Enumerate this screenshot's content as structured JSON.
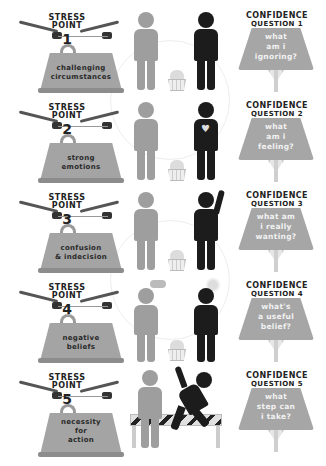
{
  "header": {
    "partial_title": ""
  },
  "rows": [
    {
      "stress": {
        "title_line1": "STRESS",
        "title_line2": "POINT",
        "number": "1",
        "label_line1": "challenging",
        "label_line2": "circumstances",
        "label_line3": ""
      },
      "figures": {
        "scene": "person-on-phone-and-standing-person-with-bucket"
      },
      "confidence": {
        "title": "CONFIDENCE",
        "subtitle": "QUESTION 1",
        "line1": "WHAT",
        "line2": "am I",
        "line3": "IGNORING?"
      }
    },
    {
      "stress": {
        "title_line1": "STRESS",
        "title_line2": "POINT",
        "number": "2",
        "label_line1": "strong",
        "label_line2": "emotions",
        "label_line3": ""
      },
      "figures": {
        "scene": "person-on-phone-and-person-with-broken-heart"
      },
      "confidence": {
        "title": "CONFIDENCE",
        "subtitle": "QUESTION 2",
        "line1": "WHAT",
        "line2": "am I",
        "line3": "FEELING?"
      }
    },
    {
      "stress": {
        "title_line1": "STRESS",
        "title_line2": "POINT",
        "number": "3",
        "label_line1": "confusion",
        "label_line2": "& indecision",
        "label_line3": ""
      },
      "figures": {
        "scene": "standing-person-and-waving-person"
      },
      "confidence": {
        "title": "CONFIDENCE",
        "subtitle": "QUESTION 3",
        "line1": "WHAT am",
        "line2": "I REALLY",
        "line3": "WANTING?"
      }
    },
    {
      "stress": {
        "title_line1": "STRESS",
        "title_line2": "POINT",
        "number": "4",
        "label_line1": "negative",
        "label_line2": "beliefs",
        "label_line3": ""
      },
      "figures": {
        "scene": "person-with-rain-cloud-and-person-with-sun"
      },
      "confidence": {
        "title": "CONFIDENCE",
        "subtitle": "QUESTION 4",
        "line1": "WHAT'S",
        "line2": "a USEFUL",
        "line3": "BELIEF?"
      }
    },
    {
      "stress": {
        "title_line1": "STRESS",
        "title_line2": "POINT",
        "number": "5",
        "label_line1": "necessity",
        "label_line2": "for",
        "label_line3": "action"
      },
      "figures": {
        "scene": "person-and-person-jumping-barrier"
      },
      "confidence": {
        "title": "CONFIDENCE",
        "subtitle": "QUESTION 5",
        "line1": "WHAT",
        "line2": "STEP CAN",
        "line3": "I TAKE?"
      }
    }
  ],
  "colors": {
    "weight": "#a4a4a4",
    "shade": "#a6a6a6",
    "gray_figure": "#9e9e9e",
    "black_figure": "#1c1c1c",
    "text": "#222222"
  }
}
